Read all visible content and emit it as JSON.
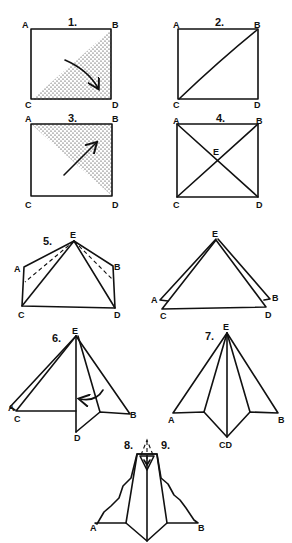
{
  "diagram": {
    "type": "origami-instructions",
    "colors": {
      "ink": "#111111",
      "background": "#ffffff"
    },
    "steps": [
      {
        "number": "1.",
        "labels": {
          "a": "A",
          "b": "B",
          "c": "C",
          "d": "D"
        },
        "note": "square with shaded lower-right triangle, fold arrow"
      },
      {
        "number": "2.",
        "labels": {
          "a": "A",
          "b": "B",
          "c": "C",
          "d": "D"
        },
        "note": "square with diagonal crease C-B"
      },
      {
        "number": "3.",
        "labels": {
          "a": "A",
          "b": "B",
          "c": "C",
          "d": "D"
        },
        "note": "square with shaded upper-right triangle, fold arrow"
      },
      {
        "number": "4.",
        "labels": {
          "a": "A",
          "b": "B",
          "c": "C",
          "d": "D",
          "e": "E"
        },
        "note": "square with both diagonals crossing at E"
      },
      {
        "number": "5.",
        "labels": {
          "a": "A",
          "b": "B",
          "c": "C",
          "d": "D",
          "e": "E"
        },
        "note": "kite shape with dashed fold lines"
      },
      {
        "number": "",
        "labels": {
          "a": "A",
          "b": "B",
          "c": "C",
          "d": "D",
          "e": "E"
        },
        "note": "triangle after folding"
      },
      {
        "number": "6.",
        "labels": {
          "a": "A",
          "b": "B",
          "c": "C",
          "d": "D",
          "e": "E"
        },
        "note": "fold D to center, arrow"
      },
      {
        "number": "7.",
        "labels": {
          "a": "A",
          "b": "B",
          "cd": "CD",
          "e": "E"
        },
        "note": "both flaps folded to center"
      },
      {
        "number": "8.",
        "number2": "9.",
        "labels": {
          "a": "A",
          "b": "B"
        },
        "note": "final bat shape with scalloped wings"
      }
    ]
  }
}
